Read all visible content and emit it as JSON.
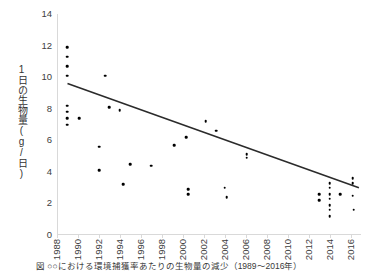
{
  "caption": "図 ○○における環境捕獲率あたりの生物量の減少（1989〜2016年）",
  "chart_data": {
    "type": "scatter",
    "title": "",
    "xlabel": "",
    "ylabel": "1日の生物量(g/日)",
    "xlim": [
      1988,
      2017
    ],
    "ylim": [
      0,
      14
    ],
    "ytick_labels": [
      "14",
      "12",
      "10",
      "8",
      "6",
      "4",
      "2",
      "0"
    ],
    "ytick_values": [
      14,
      12,
      10,
      8,
      6,
      4,
      2,
      0
    ],
    "xtick_labels": [
      "1988",
      "1990",
      "1992",
      "1994",
      "1996",
      "1998",
      "2000",
      "2002",
      "2004",
      "2006",
      "2008",
      "2010",
      "2012",
      "2014",
      "2016"
    ],
    "xtick_values": [
      1988,
      1990,
      1992,
      1994,
      1996,
      1998,
      2000,
      2002,
      2004,
      2006,
      2008,
      2010,
      2012,
      2014,
      2016
    ],
    "grid": false,
    "legend": null,
    "marker_color": "#000000",
    "trendline_color": "#2b2b2b",
    "series": [
      {
        "name": "1日の生物量",
        "points": [
          [
            1989.0,
            11.9
          ],
          [
            1989.0,
            11.3
          ],
          [
            1989.0,
            10.7
          ],
          [
            1989.0,
            10.1
          ],
          [
            1989.0,
            8.2
          ],
          [
            1989.0,
            7.8
          ],
          [
            1989.0,
            7.4
          ],
          [
            1989.0,
            7.0
          ],
          [
            1990.1,
            7.4
          ],
          [
            1992.0,
            5.6
          ],
          [
            1992.0,
            4.1
          ],
          [
            1992.6,
            10.1
          ],
          [
            1993.0,
            8.1
          ],
          [
            1994.0,
            7.9
          ],
          [
            1994.3,
            3.2
          ],
          [
            1995.0,
            4.5
          ],
          [
            1997.0,
            4.4
          ],
          [
            1999.2,
            5.7
          ],
          [
            2000.3,
            6.2
          ],
          [
            2000.5,
            2.9
          ],
          [
            2000.5,
            2.6
          ],
          [
            2002.2,
            7.2
          ],
          [
            2003.2,
            6.6
          ],
          [
            2004.0,
            3.0
          ],
          [
            2004.2,
            2.4
          ],
          [
            2006.1,
            5.1
          ],
          [
            2006.1,
            4.9
          ],
          [
            2013.0,
            2.6
          ],
          [
            2013.0,
            2.2
          ],
          [
            2014.0,
            3.3
          ],
          [
            2014.0,
            3.0
          ],
          [
            2014.0,
            2.6
          ],
          [
            2014.0,
            2.3
          ],
          [
            2014.0,
            1.9
          ],
          [
            2014.0,
            1.6
          ],
          [
            2014.0,
            1.2
          ],
          [
            2015.0,
            2.6
          ],
          [
            2016.2,
            3.6
          ],
          [
            2016.2,
            3.3
          ],
          [
            2016.2,
            2.5
          ],
          [
            2016.3,
            1.6
          ]
        ]
      }
    ],
    "trendline": {
      "x0": 1989.0,
      "y0": 9.6,
      "x1": 2016.8,
      "y1": 3.0
    }
  }
}
